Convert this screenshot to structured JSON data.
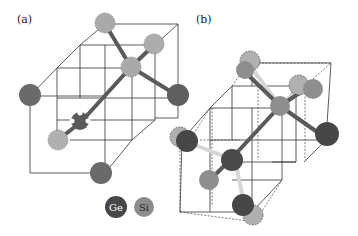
{
  "panels": [
    {
      "label": "(a)"
    },
    {
      "label": "(b)"
    }
  ],
  "legend": [
    {
      "symbol": "Ge",
      "color": "#474747"
    },
    {
      "symbol": "Si",
      "color": "#8c8c8c"
    }
  ],
  "colors": {
    "ge": "#525252",
    "si_light": "#a9a9a9",
    "si_mid": "#8e8e8e",
    "bond_dark": "#5a5a5a",
    "bond_light": "#d6d6d6",
    "edge": "#222222"
  }
}
